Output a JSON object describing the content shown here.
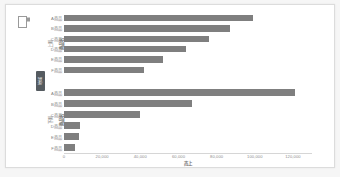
{
  "window": {
    "background_color": "#f6f6f6",
    "panel_color": "#ffffff",
    "border_color": "#dcdcdc"
  },
  "icons": {
    "corner": "document-corner-icon"
  },
  "chart_data": {
    "type": "bar",
    "orientation": "horizontal",
    "title": "",
    "xlabel": "売上",
    "ylabel": "商品名",
    "outer_group_label": "地域",
    "xlim": [
      0,
      130000
    ],
    "grid": false,
    "legend": false,
    "bar_color": "#7f7f7f",
    "xticks": [
      "0",
      "20,000",
      "40,000",
      "60,000",
      "80,000",
      "100,000",
      "120,000"
    ],
    "xtick_values": [
      0,
      20000,
      40000,
      60000,
      80000,
      100000,
      120000
    ],
    "panels": [
      {
        "group_label": "上期",
        "axis_label": "商品名",
        "categories": [
          "A商品",
          "B商品",
          "C商品",
          "D商品",
          "E商品",
          "F商品"
        ],
        "values": [
          99000,
          87000,
          76000,
          64000,
          52000,
          42000
        ],
        "labels": [
          "",
          "",
          "",
          "",
          "",
          ""
        ]
      },
      {
        "group_label": "下期",
        "axis_label": "商品名",
        "categories": [
          "A商品",
          "B商品",
          "C商品",
          "D商品",
          "E商品",
          "F商品"
        ],
        "values": [
          121000,
          67000,
          40000,
          8500,
          8000,
          6000
        ],
        "labels": [
          "",
          "",
          "",
          "",
          "",
          ""
        ]
      }
    ]
  }
}
